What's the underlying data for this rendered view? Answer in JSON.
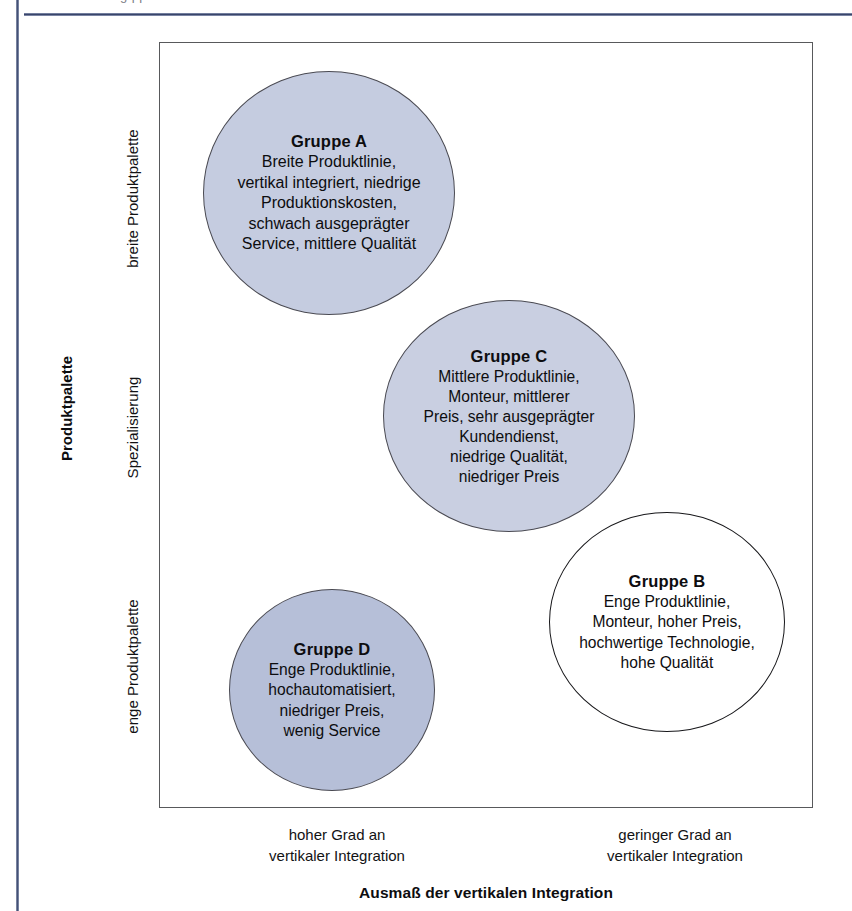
{
  "page": {
    "cut_header_fragment": "g    pp"
  },
  "chart_data": {
    "type": "scatter",
    "title": "",
    "xlabel": "Ausmaß der vertikalen Integration",
    "ylabel": "Produktpalette",
    "grid": false,
    "legend": "none",
    "x_ticks": [
      "hoher Grad an\nvertikaler Integration",
      "geringer Grad an\nvertikaler Integration"
    ],
    "y_ticks": [
      "breite Produktpalette",
      "Spezialisierung",
      "enge Produktpalette"
    ],
    "xlim": [
      "hoher Grad an vertikaler Integration",
      "geringer Grad an vertikaler Integration"
    ],
    "ylim": [
      "enge Produktpalette",
      "breite Produktpalette"
    ],
    "bubbles": [
      {
        "id": "A",
        "title": "Gruppe A",
        "description": "Breite Produktlinie,\nvertikal integriert, niedrige\nProduktionskosten,\nschwach ausgeprägter\nService, mittlere Qualität",
        "x": 0.26,
        "y": 0.84,
        "radius": 0.19,
        "fill": "#c5cce0",
        "stroke": "#4a4a52"
      },
      {
        "id": "C",
        "title": "Gruppe C",
        "description": "Mittlere Produktlinie,\nMonteur, mittlerer\nPreis, sehr ausgeprägter\nKundendienst,\nniedrige Qualität,\nniedriger Preis",
        "x": 0.54,
        "y": 0.53,
        "radius": 0.19,
        "fill": "#c9cfe1",
        "stroke": "#4a4a52"
      },
      {
        "id": "B",
        "title": "Gruppe B",
        "description": "Enge Produktlinie,\nMonteur, hoher Preis,\nhochwertige Technologie,\nhohe Qualität",
        "x": 0.79,
        "y": 0.27,
        "radius": 0.18,
        "fill": "#ffffff",
        "stroke": "#17171a"
      },
      {
        "id": "D",
        "title": "Gruppe D",
        "description": "Enge Produktlinie,\nhochautomatisiert,\nniedriger Preis,\nwenig Service",
        "x": 0.26,
        "y": 0.14,
        "radius": 0.155,
        "fill": "#b6bfd8",
        "stroke": "#4a4a52"
      }
    ],
    "colors": {
      "frame_stroke": "#58595b",
      "rule_blue": "#39456a",
      "text": "#121214",
      "page_background": "#ffffff"
    }
  }
}
